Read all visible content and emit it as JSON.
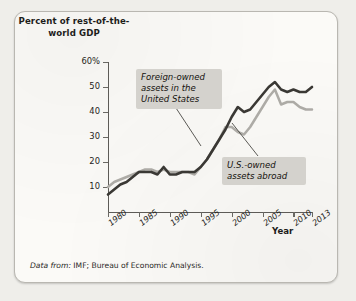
{
  "axis": {
    "y_title": "Percent of\nrest-of-the-world\nGDP",
    "x_title": "Year"
  },
  "callouts": {
    "foreign": "Foreign-owned\nassets in the\nUnited States",
    "usowned": "U.S.-owned\nassets abroad"
  },
  "source": {
    "lead": "Data from:",
    "text": " IMF; Bureau of Economic Analysis."
  },
  "colors": {
    "foreign_line": "#3a3834",
    "usowned_line": "#adaba6",
    "axis": "#5d5b57",
    "callout_bg": "#d4d2cd",
    "paper": "#fbfaf7"
  },
  "chart_data": {
    "type": "line",
    "title": "",
    "xlabel": "Year",
    "ylabel": "Percent of rest-of-the-world GDP",
    "xlim": [
      1980,
      2013
    ],
    "ylim": [
      0,
      60
    ],
    "grid": false,
    "legend": "annotations",
    "ytick_labels": [
      "60%",
      "50",
      "40",
      "30",
      "20",
      "10"
    ],
    "ytick_values": [
      60,
      50,
      40,
      30,
      20,
      10
    ],
    "xtick_labels": [
      "1980",
      "1985",
      "1990",
      "1995",
      "2000",
      "2005",
      "2010",
      "2013"
    ],
    "xtick_values": [
      1980,
      1985,
      1990,
      1995,
      2000,
      2005,
      2010,
      2013
    ],
    "x": [
      1980,
      1981,
      1982,
      1983,
      1984,
      1985,
      1986,
      1987,
      1988,
      1989,
      1990,
      1991,
      1992,
      1993,
      1994,
      1995,
      1996,
      1997,
      1998,
      1999,
      2000,
      2001,
      2002,
      2003,
      2004,
      2005,
      2006,
      2007,
      2008,
      2009,
      2010,
      2011,
      2012,
      2013
    ],
    "series": [
      {
        "name": "Foreign-owned assets in the United States",
        "color": "#3a3834",
        "values": [
          7,
          9,
          11,
          12,
          14,
          16,
          16,
          16,
          15,
          18,
          15,
          15,
          16,
          16,
          16,
          18,
          21,
          25,
          29,
          33,
          38,
          42,
          40,
          41,
          44,
          47,
          50,
          52,
          49,
          48,
          49,
          48,
          48,
          50
        ]
      },
      {
        "name": "U.S.-owned assets abroad",
        "color": "#adaba6",
        "values": [
          10,
          12,
          13,
          14,
          15,
          16,
          17,
          17,
          16,
          17,
          16,
          16,
          16,
          16,
          15,
          18,
          21,
          25,
          29,
          34,
          34,
          32,
          31,
          34,
          38,
          42,
          46,
          49,
          43,
          44,
          44,
          42,
          41,
          41
        ]
      }
    ]
  }
}
